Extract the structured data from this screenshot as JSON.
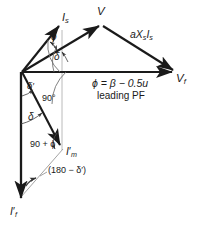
{
  "figure": {
    "type": "phasor-diagram",
    "title": "",
    "background_color": "#ffffff",
    "vector_color": "#1a1a1a",
    "thin_line_color": "#9a9a9a",
    "arc_color": "#555555"
  },
  "labels": {
    "is": "I",
    "is_sub": "s",
    "v": "V",
    "axsis": "aX",
    "axsis_sub1": "s",
    "axsis_mid": "I",
    "axsis_sub2": "s",
    "vf": "V",
    "vf_sub": "f",
    "phi_top": "ϕ",
    "delta_top": "δ",
    "delta_prime": "δ′",
    "ninety_deg": "90°",
    "delta_lower": "δ",
    "ninety_plus_phi": "90 + ϕ",
    "im": "I",
    "im_prime": "′",
    "im_sub": "m",
    "one_eighty_minus": "(180 − δ′)",
    "if": "I",
    "if_prime": "′",
    "if_sub": "f",
    "equation": "ϕ = β − 0.5u",
    "condition": "leading PF"
  },
  "geometry": {
    "origin": {
      "x": 22,
      "y": 72
    },
    "is_tip": {
      "x": 62,
      "y": 22
    },
    "v_vertex": {
      "x": 102,
      "y": 23
    },
    "vf_tip": {
      "x": 176,
      "y": 72
    },
    "im_tip": {
      "x": 63,
      "y": 148
    },
    "if_tip": {
      "x": 21,
      "y": 201
    },
    "vertical_guide_x": 62,
    "vertical_guide_top": 30,
    "vertical_guide_bottom": 150
  }
}
